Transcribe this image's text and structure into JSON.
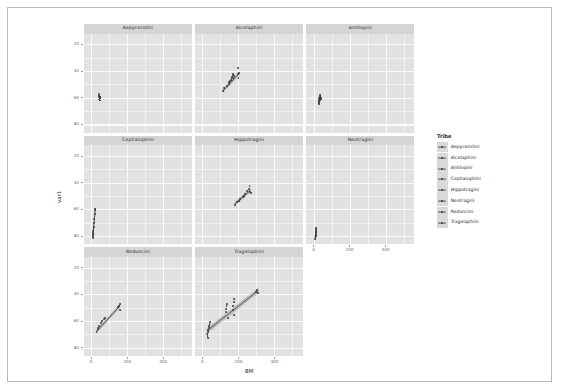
{
  "figure": {
    "type": "faceted-scatter",
    "x_axis_label": "BM",
    "y_axis_label": "var1",
    "legend_title": "Tribe"
  },
  "axes": {
    "x_ticks": [
      "0",
      "200",
      "400"
    ],
    "y_ticks": [
      "80",
      "60",
      "40",
      "20"
    ]
  },
  "legend": {
    "title": "Tribe",
    "items": [
      {
        "label": "Aepycerotini"
      },
      {
        "label": "Alcelaphini"
      },
      {
        "label": "Antilopini"
      },
      {
        "label": "Cephalophini"
      },
      {
        "label": "Hippotragini"
      },
      {
        "label": "Neotragini"
      },
      {
        "label": "Reduncini"
      },
      {
        "label": "Tragelaphini"
      }
    ]
  },
  "panels": [
    {
      "title": "Aepycerotini"
    },
    {
      "title": "Alcelaphini"
    },
    {
      "title": "Antilopini"
    },
    {
      "title": "Cephalophini"
    },
    {
      "title": "Hippotragini"
    },
    {
      "title": "Neotragini"
    },
    {
      "title": "Reduncini"
    },
    {
      "title": "Tragelaphini"
    }
  ],
  "chart_data": {
    "type": "scatter",
    "title": "",
    "xlabel": "BM",
    "ylabel": "var1",
    "xlim": [
      -40,
      560
    ],
    "ylim": [
      14,
      88
    ],
    "xticks": [
      0,
      200,
      400
    ],
    "yticks": [
      20,
      40,
      60,
      80
    ],
    "grid": true,
    "legend_position": "right",
    "legend_title": "Tribe",
    "facets": [
      {
        "name": "Aepycerotini",
        "points": [
          {
            "x": 45,
            "y": 42.5
          },
          {
            "x": 46,
            "y": 41.6
          },
          {
            "x": 47,
            "y": 40.8
          },
          {
            "x": 45,
            "y": 40.2
          },
          {
            "x": 48,
            "y": 39.4
          },
          {
            "x": 46,
            "y": 38.6
          },
          {
            "x": 47,
            "y": 37.9
          },
          {
            "x": 45,
            "y": 41.1
          },
          {
            "x": 48,
            "y": 40.5
          }
        ],
        "fit": {
          "x": [
            45,
            48
          ],
          "y": [
            39.2,
            41.0
          ]
        }
      },
      {
        "name": "Alcelaphini",
        "points": [
          {
            "x": 115,
            "y": 45.0
          },
          {
            "x": 122,
            "y": 47.2
          },
          {
            "x": 135,
            "y": 49.0
          },
          {
            "x": 148,
            "y": 51.5
          },
          {
            "x": 160,
            "y": 53.5
          },
          {
            "x": 162,
            "y": 54.5
          },
          {
            "x": 165,
            "y": 55.5
          },
          {
            "x": 168,
            "y": 56.8
          },
          {
            "x": 170,
            "y": 58.0
          },
          {
            "x": 196,
            "y": 62.0
          },
          {
            "x": 200,
            "y": 57.8
          },
          {
            "x": 201,
            "y": 55.0
          },
          {
            "x": 205,
            "y": 58.5
          },
          {
            "x": 150,
            "y": 50.0
          },
          {
            "x": 155,
            "y": 52.5
          },
          {
            "x": 172,
            "y": 55.0
          },
          {
            "x": 175,
            "y": 56.0
          }
        ],
        "fit": {
          "x": [
            115,
            205
          ],
          "y": [
            45.5,
            58.5
          ]
        }
      },
      {
        "name": "Antilopini",
        "points": [
          {
            "x": 28,
            "y": 37.5
          },
          {
            "x": 30,
            "y": 38.8
          },
          {
            "x": 32,
            "y": 39.5
          },
          {
            "x": 34,
            "y": 40.5
          },
          {
            "x": 36,
            "y": 41.2
          },
          {
            "x": 38,
            "y": 41.8
          },
          {
            "x": 30,
            "y": 36.2
          },
          {
            "x": 33,
            "y": 37.0
          },
          {
            "x": 36,
            "y": 38.0
          },
          {
            "x": 40,
            "y": 39.0
          },
          {
            "x": 42,
            "y": 40.0
          },
          {
            "x": 29,
            "y": 35.5
          }
        ],
        "fit": {
          "x": [
            28,
            42
          ],
          "y": [
            36.8,
            40.8
          ]
        }
      },
      {
        "name": "Cephalophini",
        "points": [
          {
            "x": 8,
            "y": 18.5
          },
          {
            "x": 9,
            "y": 20.0
          },
          {
            "x": 10,
            "y": 21.5
          },
          {
            "x": 12,
            "y": 24.0
          },
          {
            "x": 14,
            "y": 27.0
          },
          {
            "x": 16,
            "y": 30.0
          },
          {
            "x": 18,
            "y": 33.0
          },
          {
            "x": 20,
            "y": 36.5
          },
          {
            "x": 22,
            "y": 39.5
          },
          {
            "x": 23,
            "y": 40.5
          },
          {
            "x": 11,
            "y": 22.5
          },
          {
            "x": 13,
            "y": 25.5
          }
        ],
        "fit": {
          "x": [
            8,
            23
          ],
          "y": [
            19.0,
            40.0
          ]
        }
      },
      {
        "name": "Hippotragini",
        "points": [
          {
            "x": 180,
            "y": 43.5
          },
          {
            "x": 195,
            "y": 45.5
          },
          {
            "x": 210,
            "y": 47.5
          },
          {
            "x": 225,
            "y": 49.5
          },
          {
            "x": 238,
            "y": 51.5
          },
          {
            "x": 250,
            "y": 53.5
          },
          {
            "x": 258,
            "y": 55.5
          },
          {
            "x": 262,
            "y": 57.5
          },
          {
            "x": 265,
            "y": 53.0
          },
          {
            "x": 268,
            "y": 52.0
          },
          {
            "x": 205,
            "y": 46.5
          },
          {
            "x": 230,
            "y": 50.0
          }
        ],
        "fit": {
          "x": [
            180,
            268
          ],
          "y": [
            43.8,
            54.2
          ]
        }
      },
      {
        "name": "Neotragini",
        "points": [
          {
            "x": 10,
            "y": 18.0
          },
          {
            "x": 11,
            "y": 19.5
          },
          {
            "x": 12,
            "y": 21.0
          },
          {
            "x": 13,
            "y": 22.5
          },
          {
            "x": 14,
            "y": 24.0
          },
          {
            "x": 15,
            "y": 25.5
          },
          {
            "x": 12,
            "y": 20.0
          },
          {
            "x": 14,
            "y": 23.0
          },
          {
            "x": 16,
            "y": 26.0
          },
          {
            "x": 11,
            "y": 17.5
          }
        ],
        "fit": {
          "x": [
            10,
            16
          ],
          "y": [
            18.2,
            25.8
          ]
        }
      },
      {
        "name": "Reduncini",
        "points": [
          {
            "x": 30,
            "y": 32.0
          },
          {
            "x": 38,
            "y": 34.5
          },
          {
            "x": 45,
            "y": 36.5
          },
          {
            "x": 55,
            "y": 38.5
          },
          {
            "x": 62,
            "y": 40.0
          },
          {
            "x": 70,
            "y": 41.5
          },
          {
            "x": 75,
            "y": 42.5
          },
          {
            "x": 150,
            "y": 50.5
          },
          {
            "x": 155,
            "y": 51.5
          },
          {
            "x": 158,
            "y": 52.5
          },
          {
            "x": 160,
            "y": 48.5
          },
          {
            "x": 35,
            "y": 33.5
          }
        ],
        "fit": {
          "x": [
            30,
            160
          ],
          "y": [
            32.5,
            51.5
          ]
        }
      },
      {
        "name": "Tragelaphini",
        "points": [
          {
            "x": 28,
            "y": 30.5
          },
          {
            "x": 30,
            "y": 32.0
          },
          {
            "x": 32,
            "y": 33.5
          },
          {
            "x": 35,
            "y": 35.0
          },
          {
            "x": 38,
            "y": 36.5
          },
          {
            "x": 40,
            "y": 38.0
          },
          {
            "x": 42,
            "y": 39.5
          },
          {
            "x": 130,
            "y": 47.0
          },
          {
            "x": 132,
            "y": 49.0
          },
          {
            "x": 134,
            "y": 51.0
          },
          {
            "x": 136,
            "y": 53.0
          },
          {
            "x": 170,
            "y": 48.0
          },
          {
            "x": 172,
            "y": 51.0
          },
          {
            "x": 174,
            "y": 54.0
          },
          {
            "x": 176,
            "y": 56.5
          },
          {
            "x": 178,
            "y": 44.5
          },
          {
            "x": 145,
            "y": 42.0
          },
          {
            "x": 300,
            "y": 62.0
          },
          {
            "x": 305,
            "y": 63.5
          },
          {
            "x": 310,
            "y": 61.0
          },
          {
            "x": 29,
            "y": 28.5
          },
          {
            "x": 31,
            "y": 27.5
          }
        ],
        "fit": {
          "x": [
            28,
            312
          ],
          "y": [
            33.0,
            63.0
          ]
        }
      }
    ]
  }
}
